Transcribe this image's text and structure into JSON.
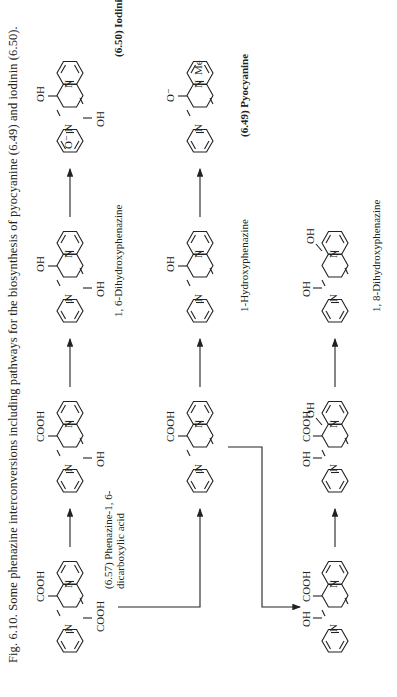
{
  "caption": "Fig. 6.10. Some phenazine interconversions including pathways for the biosynthesis of pyocyanine (6.49) and iodinin (6.50).",
  "compounds": [
    {
      "id": "6.57",
      "name": "Phenazine-1, 6-dicarboxylic acid",
      "label_line1": "(6.57) Phenazine-1, 6-",
      "label_line2": "dicarboxylic acid",
      "substituents": [
        "COOH",
        "COOH"
      ],
      "ring_numbers": [
        "1",
        "6"
      ]
    },
    {
      "id": "top2",
      "name": "6-hydroxyphenazine-1-carboxylic acid",
      "substituents": [
        "COOH",
        "OH"
      ]
    },
    {
      "id": "top3",
      "name": "1, 6-Dihydroxyphenazine",
      "label": "1, 6-Dihydroxyphenazine",
      "substituents": [
        "OH",
        "OH"
      ]
    },
    {
      "id": "top4",
      "name": "1,6-dihydroxyphenazine N-oxide",
      "substituents": [
        "OH",
        "OH",
        "O⁻"
      ],
      "charges": [
        "+"
      ]
    },
    {
      "id": "6.50",
      "name": "Iodinin",
      "label": "(6.50) Iodinin",
      "substituents": [
        "OH",
        "OH",
        "O⁻",
        "O⁻"
      ],
      "charges": [
        "+",
        "+"
      ]
    },
    {
      "id": "mid1",
      "name": "Phenazine-1-carboxylic acid",
      "substituents": [
        "COOH"
      ]
    },
    {
      "id": "mid2",
      "name": "1-Hydroxyphenazine",
      "label": "1-Hydroxyphenazine",
      "substituents": [
        "OH"
      ]
    },
    {
      "id": "6.49",
      "name": "Pyocyanine",
      "label": "(6.49) Pyocyanine",
      "substituents": [
        "O⁻",
        "Me"
      ],
      "charges": [
        "+"
      ]
    },
    {
      "id": "bot1",
      "name": "9-hydroxyphenazine-1-carboxylic acid",
      "substituents": [
        "COOH",
        "OH"
      ]
    },
    {
      "id": "bot2",
      "name": "dihydroxyphenazine carboxylic acid",
      "substituents": [
        "COOH",
        "OH",
        "OH"
      ]
    },
    {
      "id": "bot3",
      "name": "1, 8-Dihydroxyphenazine",
      "label": "1, 8-Dihydroxyphenazine",
      "substituents": [
        "OH",
        "OH"
      ]
    }
  ],
  "atoms": {
    "N": "N",
    "OH": "OH",
    "HO": "HO",
    "COOH": "COOH",
    "O_minus": "O⁻",
    "Me": "Me",
    "plus": "+"
  },
  "labels": {
    "l657a": "(6.57) Phenazine-1, 6-",
    "l657b": "dicarboxylic acid",
    "l_dihydroxy16": "1, 6-Dihydroxyphenazine",
    "l_iodinin": "(6.50)  Iodinin",
    "l_hydroxy1": "1-Hydroxyphenazine",
    "l_pyocyanine": "(6.49)  Pyocyanine",
    "l_dihydroxy18": "1, 8-Dihydroxyphenazine"
  },
  "arrows": [
    {
      "from": "6.57",
      "to": "top2"
    },
    {
      "from": "top2",
      "to": "top3"
    },
    {
      "from": "top3",
      "to": "top4"
    },
    {
      "from": "top4",
      "to": "6.50"
    },
    {
      "from": "6.57",
      "to": "mid1"
    },
    {
      "from": "mid1",
      "to": "mid2"
    },
    {
      "from": "mid2",
      "to": "6.49"
    },
    {
      "from": "mid1",
      "to": "bot1"
    },
    {
      "from": "bot1",
      "to": "bot2"
    },
    {
      "from": "bot2",
      "to": "bot3"
    }
  ]
}
